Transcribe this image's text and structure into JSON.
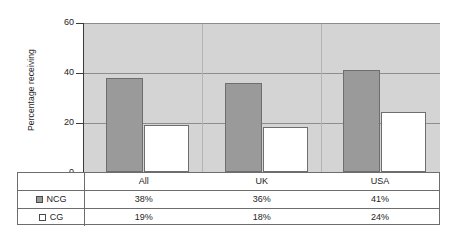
{
  "chart_data": {
    "type": "bar",
    "title": "",
    "xlabel": "",
    "ylabel": "Percentage receiving",
    "categories": [
      "All",
      "UK",
      "USA"
    ],
    "series": [
      {
        "name": "NCG",
        "values": [
          38,
          36,
          41
        ],
        "color": "#9a9a9a",
        "labels": [
          "38%",
          "36%",
          "41%"
        ]
      },
      {
        "name": "CG",
        "values": [
          19,
          18,
          24
        ],
        "color": "#ffffff",
        "labels": [
          "19%",
          "18%",
          "24%"
        ]
      }
    ],
    "ylim": [
      0,
      60
    ],
    "yticks": [
      0,
      20,
      40,
      60
    ],
    "ytick_labels": [
      "0",
      "20",
      "40",
      "60"
    ],
    "grid": true,
    "legend_position": "table-left",
    "plot_background": "#d4d4d4"
  },
  "axis": {
    "y_title": "Percentage receiving",
    "tick_60": "60",
    "tick_40": "40",
    "tick_20": "20",
    "tick_0": "0"
  },
  "table": {
    "corner_label": "",
    "categories": [
      "All",
      "UK",
      "USA"
    ],
    "rows": [
      {
        "label": "NCG",
        "swatch": "filled-gray",
        "values": [
          "38%",
          "36%",
          "41%"
        ]
      },
      {
        "label": "CG",
        "swatch": "empty-white",
        "values": [
          "19%",
          "18%",
          "24%"
        ]
      }
    ]
  }
}
